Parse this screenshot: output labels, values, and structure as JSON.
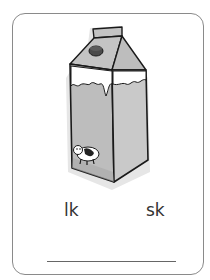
{
  "card": {
    "picture": "milk-carton",
    "choices": [
      {
        "label": "lk"
      },
      {
        "label": "sk"
      }
    ],
    "answer": ""
  },
  "colors": {
    "border": "#8a8a8a",
    "carton_fill": "#b8b8b8",
    "cap": "#4a4a4a",
    "outline": "#1a1a1a",
    "text": "#333333"
  }
}
